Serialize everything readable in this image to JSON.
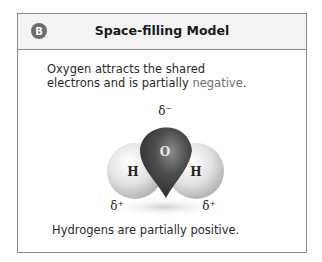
{
  "panel": {
    "badge": "B",
    "title": "Space-filling Model"
  },
  "captions": {
    "top_line1": "Oxygen attracts the shared",
    "top_line2_pre": "electrons and is partially ",
    "top_line2_highlight": "negative",
    "top_line2_post": ".",
    "bottom": "Hydrogens are partially positive."
  },
  "molecule": {
    "oxygen_label": "O",
    "hydrogen_left_label": "H",
    "hydrogen_right_label": "H",
    "charge_oxygen": "δ⁻",
    "charge_h_left": "δ⁺",
    "charge_h_right": "δ⁺",
    "colors": {
      "oxygen": "#4a4a4a",
      "hydrogen": "#e6e6e6"
    }
  }
}
